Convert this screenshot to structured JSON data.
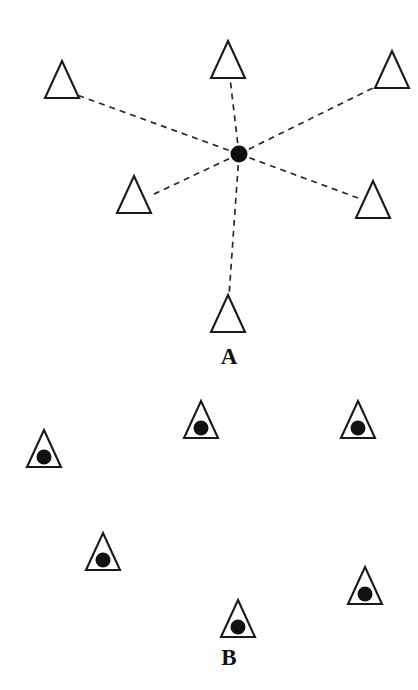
{
  "figure": {
    "background_color": "#ffffff",
    "ink_color": "#111111",
    "width": 418,
    "height": 690
  },
  "panels": [
    {
      "id": "A",
      "label": "A",
      "label_x": 229,
      "label_y": 364,
      "description": "star / hub-and-spoke topology",
      "hub": {
        "name": "center-hub-dot",
        "cx": 239,
        "cy": 154,
        "r": 8.5,
        "color": "#0d0d0d"
      },
      "connector_style": {
        "dash": "6 5",
        "width": 1.7,
        "color": "#2b2b2b"
      },
      "nodes": [
        {
          "id": "a1",
          "name": "triangle-top-left",
          "cx": 62,
          "apex_y": 61,
          "base_y": 98,
          "half_w": 17,
          "filled": false,
          "anchor_x": 77,
          "anchor_y": 95
        },
        {
          "id": "a2",
          "name": "triangle-top-center",
          "cx": 228,
          "apex_y": 41,
          "base_y": 78,
          "half_w": 17,
          "filled": false,
          "anchor_x": 230,
          "anchor_y": 78
        },
        {
          "id": "a3",
          "name": "triangle-top-right",
          "cx": 392,
          "apex_y": 51,
          "base_y": 88,
          "half_w": 17,
          "filled": false,
          "anchor_x": 377,
          "anchor_y": 86
        },
        {
          "id": "a4",
          "name": "triangle-mid-left",
          "cx": 134,
          "apex_y": 176,
          "base_y": 213,
          "half_w": 17,
          "filled": false,
          "anchor_x": 150,
          "anchor_y": 196
        },
        {
          "id": "a5",
          "name": "triangle-mid-right",
          "cx": 373,
          "apex_y": 181,
          "base_y": 218,
          "half_w": 17,
          "filled": false,
          "anchor_x": 358,
          "anchor_y": 198
        },
        {
          "id": "a6",
          "name": "triangle-bottom",
          "cx": 228,
          "apex_y": 295,
          "base_y": 332,
          "half_w": 17,
          "filled": false,
          "anchor_x": 229,
          "anchor_y": 296
        }
      ],
      "edges": [
        {
          "from": "hub",
          "to": "a1"
        },
        {
          "from": "hub",
          "to": "a2"
        },
        {
          "from": "hub",
          "to": "a3"
        },
        {
          "from": "hub",
          "to": "a4"
        },
        {
          "from": "hub",
          "to": "a5"
        },
        {
          "from": "hub",
          "to": "a6"
        }
      ]
    },
    {
      "id": "B",
      "label": "B",
      "label_x": 229,
      "label_y": 665,
      "description": "scattered independent nodes, each triangle contains a filled dot",
      "connector_style": null,
      "nodes": [
        {
          "id": "b1",
          "name": "triangle-node-left",
          "cx": 44,
          "apex_y": 430,
          "base_y": 467,
          "half_w": 17,
          "filled": true,
          "dot_r": 7.5,
          "dot_cy": 457
        },
        {
          "id": "b2",
          "name": "triangle-node-top-center",
          "cx": 201,
          "apex_y": 401,
          "base_y": 438,
          "half_w": 17,
          "filled": true,
          "dot_r": 7.5,
          "dot_cy": 428
        },
        {
          "id": "b3",
          "name": "triangle-node-top-right",
          "cx": 358,
          "apex_y": 401,
          "base_y": 438,
          "half_w": 17,
          "filled": true,
          "dot_r": 7.5,
          "dot_cy": 428
        },
        {
          "id": "b4",
          "name": "triangle-node-mid-left",
          "cx": 103,
          "apex_y": 533,
          "base_y": 570,
          "half_w": 17,
          "filled": true,
          "dot_r": 7.5,
          "dot_cy": 560
        },
        {
          "id": "b5",
          "name": "triangle-node-mid-right",
          "cx": 365,
          "apex_y": 567,
          "base_y": 604,
          "half_w": 17,
          "filled": true,
          "dot_r": 7.5,
          "dot_cy": 594
        },
        {
          "id": "b6",
          "name": "triangle-node-bottom",
          "cx": 238,
          "apex_y": 600,
          "base_y": 637,
          "half_w": 17,
          "filled": true,
          "dot_r": 7.5,
          "dot_cy": 627
        }
      ],
      "edges": []
    }
  ],
  "chart_data": {
    "type": "diagram",
    "title": "",
    "panel_labels": [
      "A",
      "B"
    ],
    "panel_a_node_count": 6,
    "panel_a_hub_count": 1,
    "panel_a_edge_count": 6,
    "panel_b_node_count": 6,
    "panel_b_edge_count": 0
  }
}
